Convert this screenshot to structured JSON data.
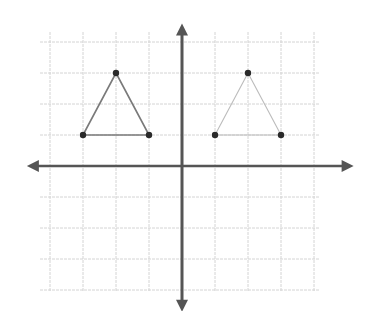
{
  "figure": {
    "colors": {
      "background": "#ffffff",
      "grid": "#d4d4d4",
      "axis": "#555555",
      "left_triangle": "#7a7a7a",
      "right_triangle": "#bcbcbc",
      "vertex": "#2a2a2a"
    },
    "grid": {
      "x_range": [
        -4,
        4
      ],
      "y_range": [
        -4,
        4
      ],
      "origin_px": [
        182,
        166
      ],
      "unit_px": [
        33,
        31
      ]
    },
    "axes": {
      "x_axis": {
        "from": [
          -4.7,
          0
        ],
        "to": [
          5.2,
          0
        ],
        "arrows": "both"
      },
      "y_axis": {
        "from": [
          0,
          4.6
        ],
        "to": [
          0,
          -4.7
        ],
        "arrows": "both"
      }
    },
    "shapes": [
      {
        "name": "left-triangle",
        "vertices": [
          [
            -3,
            1
          ],
          [
            -2,
            3
          ],
          [
            -1,
            1
          ]
        ]
      },
      {
        "name": "right-triangle",
        "vertices": [
          [
            1,
            1
          ],
          [
            2,
            3
          ],
          [
            3,
            1
          ]
        ]
      }
    ]
  }
}
